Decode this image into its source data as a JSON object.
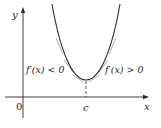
{
  "figure": {
    "axes": {
      "x_label": "x",
      "y_label": "y",
      "origin_label": "0",
      "x_tick_label": "c"
    },
    "annotations": {
      "left_region": "f′(x) < 0",
      "right_region": "f′(x) > 0"
    },
    "colors": {
      "curve": "#2a2a2a",
      "tangent": "#9a9a9a",
      "axis": "#2a2a2a"
    }
  }
}
